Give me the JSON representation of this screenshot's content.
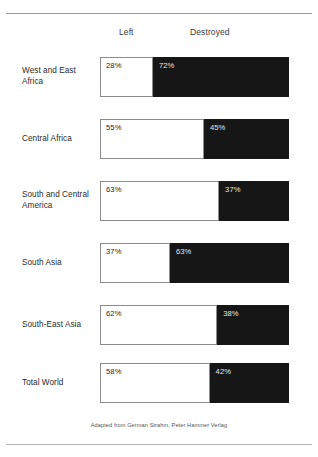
{
  "chart_data": {
    "type": "bar",
    "subtype": "stacked-horizontal-100",
    "title": "",
    "xlabel": "",
    "ylabel": "",
    "xlim": [
      0,
      100
    ],
    "grid": false,
    "legend_position": "top",
    "categories": [
      "West and East Africa",
      "Central Africa",
      "South and Central America",
      "South Asia",
      "South-East Asia",
      "Total World"
    ],
    "series": [
      {
        "name": "Left",
        "color": "#ffffff",
        "values": [
          28,
          55,
          63,
          37,
          62,
          58
        ],
        "labels": [
          "28%",
          "55%",
          "63%",
          "37%",
          "62%",
          "58%"
        ]
      },
      {
        "name": "Destroyed",
        "color": "#161616",
        "values": [
          72,
          45,
          37,
          63,
          38,
          42
        ],
        "labels": [
          "72%",
          "45%",
          "37%",
          "63%",
          "38%",
          "42%"
        ]
      }
    ],
    "annotations": [
      "Adapted from German Strahm, Peter Hammer Verlag"
    ]
  },
  "headers": {
    "left": "Left",
    "destroyed": "Destroyed"
  },
  "rows": [
    {
      "label": "West and East Africa",
      "left_value": 28,
      "left_label": "28%",
      "right_value": 72,
      "right_label": "72%"
    },
    {
      "label": "Central Africa",
      "left_value": 55,
      "left_label": "55%",
      "right_value": 45,
      "right_label": "45%"
    },
    {
      "label": "South and Central America",
      "left_value": 63,
      "left_label": "63%",
      "right_value": 37,
      "right_label": "37%"
    },
    {
      "label": "South Asia",
      "left_value": 37,
      "left_label": "37%",
      "right_value": 63,
      "right_label": "63%"
    },
    {
      "label": "South-East Asia",
      "left_value": 62,
      "left_label": "62%",
      "right_value": 38,
      "right_label": "38%"
    },
    {
      "label": "Total World",
      "left_value": 58,
      "left_label": "58%",
      "right_value": 42,
      "right_label": "42%"
    }
  ],
  "credit": "Adapted from German Strahm, Peter Hammer Verlag",
  "colors": {
    "left_fill": "#ffffff",
    "left_border": "#8c8c8c",
    "right_fill": "#161616",
    "rule": "#9a9a9a",
    "text": "#2b2b2b"
  },
  "layout": {
    "bar_left_px": 100,
    "bar_width_px": 189,
    "bar_height_px": 40,
    "row_tops_px": [
      57,
      119,
      181,
      243,
      305,
      363
    ]
  }
}
